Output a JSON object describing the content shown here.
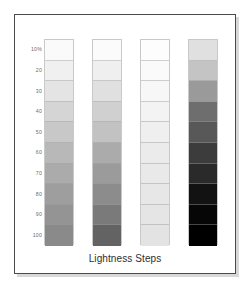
{
  "figure": {
    "caption": "Lightness Steps",
    "background_color": "#ffffff",
    "frame_color": "#4a4a4a",
    "shadow_color": "#d8d8d8",
    "label_color": "#6b6b6b",
    "swatch_border_color": "#c9c9c9"
  },
  "chart_data": {
    "type": "heatmap",
    "title": "Lightness Steps",
    "xlabel": "",
    "ylabel": "",
    "grid": false,
    "legend": "none",
    "categories": [
      "10%",
      "20",
      "30",
      "40",
      "50",
      "60",
      "70",
      "80",
      "90",
      "100"
    ],
    "tick_labels": [
      "10%",
      "20",
      "30",
      "40",
      "50",
      "60",
      "70",
      "80",
      "90",
      "100"
    ],
    "values": [
      10,
      20,
      30,
      40,
      50,
      60,
      70,
      80,
      90,
      100
    ],
    "ylim": [
      10,
      100
    ],
    "series": [
      {
        "name": "Column 1",
        "values": [
          10,
          20,
          30,
          40,
          50,
          60,
          70,
          80,
          90,
          100
        ],
        "colors": [
          "#fafafa",
          "#f0f0f0",
          "#e4e4e4",
          "#d5d5d5",
          "#c8c8c8",
          "#b8b8b8",
          "#ababab",
          "#9e9e9e",
          "#949494",
          "#8a8a8a"
        ]
      },
      {
        "name": "Column 2",
        "values": [
          10,
          20,
          30,
          40,
          50,
          60,
          70,
          80,
          90,
          100
        ],
        "colors": [
          "#fbfbfb",
          "#efefef",
          "#e0e0e0",
          "#d0d0d0",
          "#c2c2c2",
          "#ababab",
          "#9b9b9b",
          "#8c8c8c",
          "#7a7a7a",
          "#636363"
        ]
      },
      {
        "name": "Column 3",
        "values": [
          10,
          20,
          30,
          40,
          50,
          60,
          70,
          80,
          90,
          100
        ],
        "colors": [
          "#fdfdfd",
          "#fafafa",
          "#f7f7f7",
          "#f3f3f3",
          "#efefef",
          "#ebebeb",
          "#e9e9e9",
          "#e7e7e7",
          "#e5e5e5",
          "#e3e3e3"
        ]
      },
      {
        "name": "Column 4",
        "values": [
          10,
          20,
          30,
          40,
          50,
          60,
          70,
          80,
          90,
          100
        ],
        "colors": [
          "#e0e0e0",
          "#c4c4c4",
          "#9a9a9a",
          "#6e6e6e",
          "#585858",
          "#3c3c3c",
          "#2a2a2a",
          "#121212",
          "#060606",
          "#000000"
        ]
      }
    ]
  }
}
